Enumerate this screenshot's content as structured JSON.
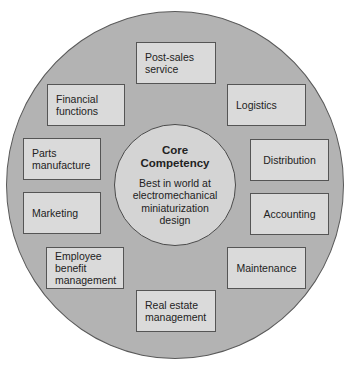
{
  "diagram": {
    "type": "concentric-circles",
    "core": {
      "title": "Core\nCompetency",
      "title_line1": "Core",
      "title_line2": "Competency",
      "description": "Best in world at electromechanical miniaturization design",
      "description_lines": [
        "Best in world at",
        "electromechanical",
        "miniaturization",
        "design"
      ]
    },
    "activities": [
      {
        "id": "post-sales-service",
        "label": "Post-sales\nservice"
      },
      {
        "id": "logistics",
        "label": "Logistics"
      },
      {
        "id": "distribution",
        "label": "Distribution"
      },
      {
        "id": "accounting",
        "label": "Accounting"
      },
      {
        "id": "maintenance",
        "label": "Maintenance"
      },
      {
        "id": "real-estate-management",
        "label": "Real estate\nmanagement"
      },
      {
        "id": "employee-benefit-management",
        "label": "Employee\nbenefit\nmanagement"
      },
      {
        "id": "marketing",
        "label": "Marketing"
      },
      {
        "id": "parts-manufacture",
        "label": "Parts\nmanufacture"
      },
      {
        "id": "financial-functions",
        "label": "Financial\nfunctions"
      }
    ],
    "colors": {
      "outer_ring": "#b3b3b3",
      "inner_circle": "#d4d4d4",
      "box_fill": "#dadada",
      "border": "#555555",
      "text": "#222222"
    }
  }
}
